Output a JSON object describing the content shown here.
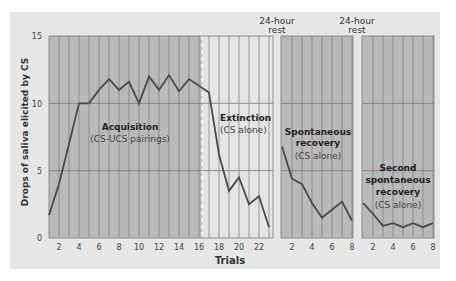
{
  "chart_data": {
    "type": "line",
    "title": "",
    "xlabel": "Trials",
    "ylabel": "Drops of saliva elicited by CS",
    "ylim": [
      0,
      15
    ],
    "yticks": [
      0,
      5,
      10,
      15
    ],
    "grid": true,
    "panels": [
      {
        "name": "Acquisition",
        "label": "Acquisition",
        "sublabel": "(CS-UCS pairings)",
        "x": [
          1,
          2,
          3,
          4,
          5,
          6,
          7,
          8,
          9,
          10,
          11,
          12,
          13,
          14,
          15,
          16
        ],
        "values": [
          1.7,
          4.0,
          7.0,
          10.0,
          10.0,
          11.0,
          11.8,
          11.0,
          11.6,
          10.0,
          12.0,
          11.0,
          12.1,
          10.9,
          11.8,
          11.3
        ]
      },
      {
        "name": "Extinction",
        "label": "Extinction",
        "sublabel": "(CS alone)",
        "x": [
          16,
          17,
          18,
          19,
          20,
          21,
          22,
          23
        ],
        "values": [
          11.3,
          10.8,
          6.2,
          3.5,
          4.5,
          2.5,
          3.1,
          0.8
        ]
      },
      {
        "name": "Spontaneous recovery",
        "label": [
          "Spontaneous",
          "recovery"
        ],
        "sublabel": "(CS alone)",
        "x": [
          1,
          2,
          3,
          4,
          5,
          6,
          7,
          8
        ],
        "values": [
          6.8,
          4.4,
          4.0,
          2.6,
          1.5,
          2.1,
          2.7,
          1.3
        ]
      },
      {
        "name": "Second spontaneous recovery",
        "label": [
          "Second",
          "spontaneous",
          "recovery"
        ],
        "sublabel": "(CS alone)",
        "x": [
          1,
          2,
          3,
          4,
          5,
          6,
          7,
          8
        ],
        "values": [
          2.6,
          1.8,
          0.9,
          1.1,
          0.8,
          1.1,
          0.8,
          1.1
        ]
      }
    ],
    "xticks_main": [
      2,
      4,
      6,
      8,
      10,
      12,
      14,
      16,
      18,
      20,
      22
    ],
    "xticks_recovery": [
      2,
      4,
      6,
      8
    ],
    "annotations": [
      "24-hour rest",
      "24-hour rest"
    ],
    "colors": {
      "background": "#e6e6e6",
      "acquisition_fill": "#b9b9b9",
      "extinction_fill": "#e4e4e4",
      "recovery_fill": "#b9b9b9",
      "grid": "#7a7a7a",
      "line": "#4a4a4a"
    }
  },
  "annotations": {
    "rest1_line1": "24-hour",
    "rest1_line2": "rest",
    "rest2_line1": "24-hour",
    "rest2_line2": "rest"
  },
  "axis": {
    "ylabel": "Drops of saliva elicited by CS",
    "xlabel": "Trials",
    "y15": "15",
    "y10": "10",
    "y5": "5",
    "y0": "0"
  }
}
